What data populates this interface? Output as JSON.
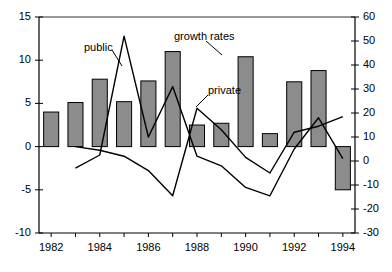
{
  "chart_data": {
    "type": "bar",
    "title": "",
    "subtitle": "",
    "xlabel": "",
    "ylabel": "",
    "grid": false,
    "legend_position": "inline-annotations",
    "categories": [
      "1982",
      "1983",
      "1984",
      "1985",
      "1986",
      "1987",
      "1988",
      "1989",
      "1990",
      "1991",
      "1992",
      "1993",
      "1994"
    ],
    "bars": {
      "name": "investment level",
      "axis": "left",
      "values": [
        4.0,
        5.1,
        7.8,
        5.2,
        7.6,
        11.0,
        2.5,
        2.7,
        10.4,
        1.5,
        7.5,
        8.8,
        -5.0
      ]
    },
    "series": [
      {
        "name": "public",
        "axis": "right",
        "label": "public",
        "values": [
          null,
          -3.0,
          2.5,
          52.0,
          10.0,
          31.0,
          2.0,
          -2.0,
          -11.0,
          -14.5,
          5.0,
          18.0,
          1.0
        ]
      },
      {
        "name": "private",
        "axis": "right",
        "label": "private",
        "values": [
          null,
          6.0,
          4.5,
          2.0,
          -4.0,
          -14.5,
          22.0,
          13.0,
          1.5,
          -5.0,
          12.0,
          14.5,
          18.5
        ]
      }
    ],
    "axes": {
      "left": {
        "label": "",
        "min": -10,
        "max": 15,
        "ticks": [
          15,
          10,
          5,
          0,
          -5,
          -10
        ],
        "tick_labels": [
          "15",
          "10",
          "5",
          "0",
          "-5",
          "-10"
        ]
      },
      "right": {
        "label": "",
        "min": -30,
        "max": 60,
        "ticks": [
          60,
          50,
          40,
          30,
          20,
          10,
          0,
          -10,
          -20,
          -30
        ],
        "tick_labels": [
          "60",
          "50",
          "40",
          "30",
          "20",
          "10",
          "0",
          "-10",
          "-20",
          "-30"
        ]
      },
      "x": {
        "label": "",
        "tick_labels": [
          "1982",
          "1984",
          "1986",
          "1988",
          "1990",
          "1992",
          "1994"
        ]
      }
    },
    "annotations": [
      {
        "name": "public-label",
        "text": "public",
        "x": 84,
        "y": 41
      },
      {
        "name": "growth-rates-label",
        "text": "growth rates",
        "x": 174,
        "y": 30
      },
      {
        "name": "private-label",
        "text": "private",
        "x": 208,
        "y": 84
      }
    ],
    "colors": {
      "bar_fill": "#8c8c8c",
      "bar_stroke": "#000000",
      "line": "#000000",
      "axis": "#000000",
      "background": "#ffffff"
    }
  }
}
